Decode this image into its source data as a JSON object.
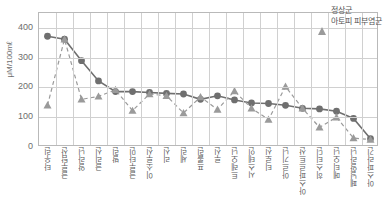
{
  "figure": {
    "title_strip": "",
    "legend_position": "top-right"
  },
  "legend": {
    "series1_label": "정상군",
    "series2_label": "아토피 피부염군",
    "series1_marker": "circle-marker-icon",
    "series2_marker": "triangle-marker-icon"
  },
  "axes": {
    "y_title": "μM/100mℓ",
    "y_ticks": [
      "400",
      "300",
      "200",
      "100",
      "0"
    ],
    "y_min": 0,
    "y_max": 450
  },
  "colors": {
    "series1": "#6f6f6f",
    "series2": "#9a9a9a",
    "grid": "#d0d0d0",
    "frame": "#b9b9b9",
    "text": "#5a5a5a"
  },
  "chart_data": {
    "type": "line",
    "title": "",
    "xlabel": "",
    "ylabel": "μM/100mℓ",
    "ylim": [
      0,
      450
    ],
    "yticks": [
      0,
      100,
      200,
      300,
      400
    ],
    "grid": true,
    "legend": "top-right",
    "categories": [
      "타우린",
      "글루탐산",
      "알라닌",
      "글리신",
      "발린",
      "글루타민",
      "이소루신",
      "리신",
      "세린",
      "프롤린",
      "루신",
      "트레오닌",
      "시스테인",
      "티로신",
      "아르기닌",
      "아스파르트산",
      "히스티딘",
      "메티오닌",
      "페닐알라닌",
      "아스파라긴"
    ],
    "series": [
      {
        "name": "정상군",
        "marker": "circle",
        "linestyle": "solid",
        "values": [
          372,
          362,
          290,
          222,
          186,
          186,
          183,
          180,
          178,
          160,
          172,
          158,
          148,
          146,
          140,
          130,
          128,
          120,
          96,
          28
        ]
      },
      {
        "name": "아토피 피부염군",
        "marker": "triangle",
        "linestyle": "dashed",
        "values": [
          140,
          362,
          160,
          170,
          192,
          122,
          178,
          172,
          114,
          168,
          126,
          188,
          130,
          92,
          203,
          130,
          66,
          100,
          30,
          25
        ]
      }
    ]
  }
}
